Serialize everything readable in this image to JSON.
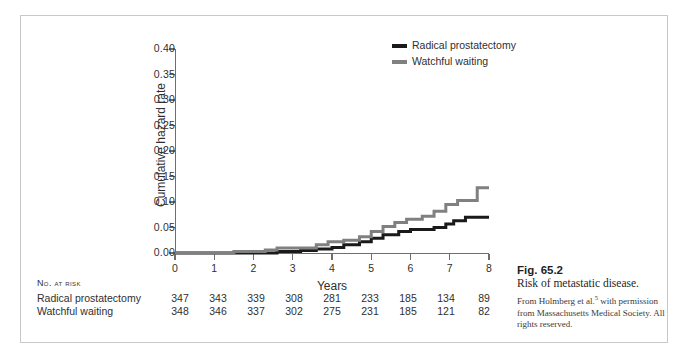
{
  "figure": {
    "caption_number": "Fig. 65.2",
    "caption_title": "Risk of metastatic disease.",
    "caption_source_pre": "From Holmberg et al.",
    "caption_source_ref": "5",
    "caption_source_post": " with permission from Massachusetts Medical Society. All rights reserved."
  },
  "risk_table": {
    "title": "No. at Risk",
    "rows": [
      {
        "label": "Radical prostatectomy",
        "values": [
          347,
          343,
          339,
          308,
          281,
          233,
          185,
          134,
          89
        ]
      },
      {
        "label": "Watchful waiting",
        "values": [
          348,
          346,
          337,
          302,
          275,
          231,
          185,
          121,
          82
        ]
      }
    ]
  },
  "chart_data": {
    "type": "line",
    "title": "",
    "xlabel": "Years",
    "ylabel": "Cumulative hazard rate",
    "xlim": [
      0,
      8
    ],
    "ylim": [
      0,
      0.4
    ],
    "grid": false,
    "legend_position": "top-right",
    "x_ticks": [
      "0",
      "1",
      "2",
      "3",
      "4",
      "5",
      "6",
      "7",
      "8"
    ],
    "y_ticks": [
      "0.00",
      "0.05",
      "0.10",
      "0.15",
      "0.20",
      "0.25",
      "0.30",
      "0.35",
      "0.40"
    ],
    "colors": {
      "radical_prostatectomy": "#1a1a1a",
      "watchful_waiting": "#808080"
    },
    "series": [
      {
        "name": "Radical prostatectomy",
        "color": "#1a1a1a",
        "step": true,
        "points": [
          [
            0.0,
            0.0
          ],
          [
            2.6,
            0.0
          ],
          [
            2.6,
            0.003
          ],
          [
            3.2,
            0.003
          ],
          [
            3.2,
            0.005
          ],
          [
            3.6,
            0.005
          ],
          [
            3.6,
            0.008
          ],
          [
            4.0,
            0.008
          ],
          [
            4.0,
            0.011
          ],
          [
            4.3,
            0.011
          ],
          [
            4.3,
            0.016
          ],
          [
            4.7,
            0.016
          ],
          [
            4.7,
            0.022
          ],
          [
            5.0,
            0.022
          ],
          [
            5.0,
            0.029
          ],
          [
            5.3,
            0.029
          ],
          [
            5.3,
            0.036
          ],
          [
            5.7,
            0.036
          ],
          [
            5.7,
            0.042
          ],
          [
            6.0,
            0.042
          ],
          [
            6.0,
            0.046
          ],
          [
            6.6,
            0.046
          ],
          [
            6.6,
            0.05
          ],
          [
            6.9,
            0.05
          ],
          [
            6.9,
            0.057
          ],
          [
            7.1,
            0.057
          ],
          [
            7.1,
            0.063
          ],
          [
            7.4,
            0.063
          ],
          [
            7.4,
            0.07
          ],
          [
            8.0,
            0.07
          ]
        ]
      },
      {
        "name": "Watchful waiting",
        "color": "#808080",
        "step": true,
        "points": [
          [
            0.0,
            0.0
          ],
          [
            1.5,
            0.0
          ],
          [
            1.5,
            0.003
          ],
          [
            2.3,
            0.003
          ],
          [
            2.3,
            0.006
          ],
          [
            2.6,
            0.006
          ],
          [
            2.6,
            0.01
          ],
          [
            3.6,
            0.01
          ],
          [
            3.6,
            0.016
          ],
          [
            3.9,
            0.016
          ],
          [
            3.9,
            0.022
          ],
          [
            4.3,
            0.022
          ],
          [
            4.3,
            0.025
          ],
          [
            4.7,
            0.025
          ],
          [
            4.7,
            0.032
          ],
          [
            5.0,
            0.032
          ],
          [
            5.0,
            0.042
          ],
          [
            5.3,
            0.042
          ],
          [
            5.3,
            0.052
          ],
          [
            5.6,
            0.052
          ],
          [
            5.6,
            0.06
          ],
          [
            5.9,
            0.06
          ],
          [
            5.9,
            0.066
          ],
          [
            6.3,
            0.066
          ],
          [
            6.3,
            0.072
          ],
          [
            6.6,
            0.072
          ],
          [
            6.6,
            0.082
          ],
          [
            6.9,
            0.082
          ],
          [
            6.9,
            0.095
          ],
          [
            7.2,
            0.095
          ],
          [
            7.2,
            0.103
          ],
          [
            7.7,
            0.103
          ],
          [
            7.7,
            0.128
          ],
          [
            8.0,
            0.128
          ]
        ]
      }
    ]
  }
}
